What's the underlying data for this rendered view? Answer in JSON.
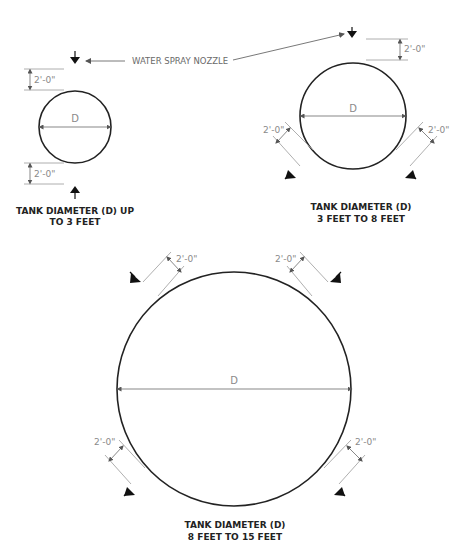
{
  "diagram": {
    "type": "engineering-detail",
    "callout": {
      "label": "WATER SPRAY NOZZLE"
    },
    "dimension_label": "2'-0\"",
    "diameter_label": "D",
    "tanks": [
      {
        "id": "small",
        "caption_line1": "TANK DIAMETER (D) UP",
        "caption_line2": "TO 3 FEET",
        "nozzle_count": 2,
        "nozzle_positions": [
          "top",
          "bottom"
        ],
        "clearance": "2'-0\""
      },
      {
        "id": "medium",
        "caption_line1": "TANK DIAMETER (D)",
        "caption_line2": "3 FEET TO 8 FEET",
        "nozzle_count": 3,
        "nozzle_positions": [
          "top",
          "lower-left",
          "lower-right"
        ],
        "clearance": "2'-0\""
      },
      {
        "id": "large",
        "caption_line1": "TANK DIAMETER (D)",
        "caption_line2": "8 FEET TO 15 FEET",
        "nozzle_count": 4,
        "nozzle_positions": [
          "upper-left",
          "upper-right",
          "lower-left",
          "lower-right"
        ],
        "clearance": "2'-0\""
      }
    ]
  }
}
